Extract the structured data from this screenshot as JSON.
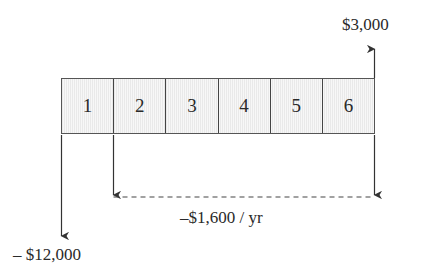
{
  "diagram": {
    "type": "cash-flow-diagram",
    "periods": [
      "1",
      "2",
      "3",
      "4",
      "5",
      "6"
    ],
    "cash_flows": {
      "initial": {
        "label": "– $12,000",
        "period": 0,
        "direction": "down"
      },
      "annual": {
        "label": "–$1,600 / yr",
        "from_period": 1,
        "to_period": 6,
        "direction": "down"
      },
      "final": {
        "label": "$3,000",
        "period": 6,
        "direction": "up"
      }
    },
    "colors": {
      "line": "#333333",
      "fill": "#f0f0f0"
    }
  }
}
